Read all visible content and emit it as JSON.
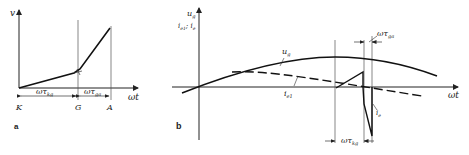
{
  "panel_a": {
    "label": "a",
    "y_axis_label": "v",
    "x_axis_label": "ωt",
    "points": {
      "start": "K",
      "middle": "G",
      "end": "A"
    },
    "intervals": [
      {
        "symbol": "ωτ",
        "subscript": "kg"
      },
      {
        "symbol": "ωτ",
        "subscript": "ga"
      }
    ]
  },
  "panel_b": {
    "label": "b",
    "y_axis_label_main": "u",
    "y_axis_label_main_sub": "g",
    "y_axis_label_secondary": "i",
    "y_axis_label_secondary_sub1": "e1",
    "y_axis_label_secondary_sep": "; ",
    "y_axis_label_secondary2": "i",
    "y_axis_label_secondary2_sub": "e",
    "x_axis_label": "ωt",
    "curves": [
      {
        "name": "u",
        "sub": "g",
        "style": "solid"
      },
      {
        "name": "i",
        "sub": "e1",
        "style": "dashed"
      },
      {
        "name": "i",
        "sub": "e",
        "style": "pulse"
      }
    ],
    "intervals": [
      {
        "symbol": "ωτ",
        "subscript": "ga"
      },
      {
        "symbol": "ωτ",
        "subscript": "kg"
      }
    ]
  }
}
